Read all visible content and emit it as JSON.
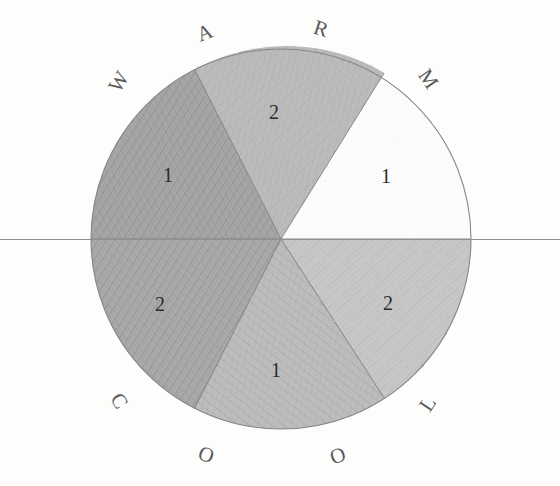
{
  "figure": {
    "medium": "pencil shading on paper",
    "background_color": "#fdfdfc",
    "outline_color": "#8a8a8a",
    "letter_color": "#5a5a5a",
    "number_color": "#2b2b2b",
    "circle": {
      "center_x": 281,
      "center_y": 239,
      "radius": 190
    },
    "diameter_line": {
      "label": "horizontal-axis",
      "x1": 0,
      "y1": 239,
      "x2": 560,
      "y2": 239,
      "color": "#8f8f8f"
    }
  },
  "ring_labels": [
    {
      "id": "letter-w",
      "text": "W",
      "x": 119,
      "y": 82,
      "rotation": -58
    },
    {
      "id": "letter-a",
      "text": "A",
      "x": 205,
      "y": 33,
      "rotation": -20
    },
    {
      "id": "letter-r",
      "text": "R",
      "x": 321,
      "y": 29,
      "rotation": 18
    },
    {
      "id": "letter-m",
      "text": "M",
      "x": 428,
      "y": 79,
      "rotation": 56
    },
    {
      "id": "letter-c",
      "text": "C",
      "x": 119,
      "y": 401,
      "rotation": 58
    },
    {
      "id": "letter-o1",
      "text": "O",
      "x": 206,
      "y": 455,
      "rotation": 20
    },
    {
      "id": "letter-o2",
      "text": "O",
      "x": 338,
      "y": 456,
      "rotation": -20
    },
    {
      "id": "letter-l",
      "text": "L",
      "x": 428,
      "y": 404,
      "rotation": -56
    }
  ],
  "sectors": [
    {
      "id": "sector-warm-1",
      "number": "1",
      "label_x": 168,
      "label_y": 175,
      "start_angle": 180,
      "end_angle": 243,
      "fill": "#9f9f9f",
      "group": "warm",
      "shading": "dark"
    },
    {
      "id": "sector-warm-2",
      "number": "2",
      "label_x": 274,
      "label_y": 112,
      "start_angle": 243,
      "end_angle": 303,
      "fill": "#b4b4b4",
      "group": "warm",
      "shading": "medium"
    },
    {
      "id": "sector-warm-3",
      "number": "1",
      "label_x": 386,
      "label_y": 176,
      "start_angle": 303,
      "end_angle": 360,
      "fill": "#ffffff",
      "group": "warm",
      "shading": "none"
    },
    {
      "id": "sector-cool-2",
      "number": "2",
      "label_x": 388,
      "label_y": 303,
      "start_angle": 0,
      "end_angle": 57,
      "fill": "#c3c3c3",
      "group": "cool",
      "shading": "light"
    },
    {
      "id": "sector-cool-1",
      "number": "1",
      "label_x": 276,
      "label_y": 370,
      "start_angle": 57,
      "end_angle": 117,
      "fill": "#b9b9b9",
      "group": "cool",
      "shading": "medium"
    },
    {
      "id": "sector-cool-3",
      "number": "2",
      "label_x": 160,
      "label_y": 304,
      "start_angle": 117,
      "end_angle": 180,
      "fill": "#a3a3a3",
      "group": "cool",
      "shading": "dark"
    }
  ],
  "divider_lines": [
    {
      "id": "divider-w-a",
      "angle": 243
    },
    {
      "id": "divider-a-r",
      "angle": 303
    },
    {
      "id": "divider-m-l",
      "angle": 0
    },
    {
      "id": "divider-l-o",
      "angle": 57
    },
    {
      "id": "divider-o-c",
      "angle": 117
    },
    {
      "id": "divider-c-w",
      "angle": 180
    }
  ]
}
